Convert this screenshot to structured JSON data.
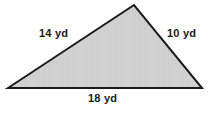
{
  "figure": {
    "name": "triangle-figure",
    "shape": "triangle",
    "background_color": "#ffffff",
    "fill_color": "#d2d2d2",
    "stroke_color": "#1a1a1a",
    "stroke_width": 2,
    "unit": "yd",
    "vertices": {
      "left": [
        8,
        88
      ],
      "apex": [
        134,
        5
      ],
      "right": [
        202,
        88
      ]
    },
    "labels": {
      "left_side": "14 yd",
      "right_side": "10 yd",
      "bottom_side": "18 yd"
    },
    "measurements": [
      {
        "side": "left",
        "value": 14,
        "unit": "yd",
        "text": "14 yd"
      },
      {
        "side": "right",
        "value": 10,
        "unit": "yd",
        "text": "10 yd"
      },
      {
        "side": "bottom",
        "value": 18,
        "unit": "yd",
        "text": "18 yd"
      }
    ]
  }
}
